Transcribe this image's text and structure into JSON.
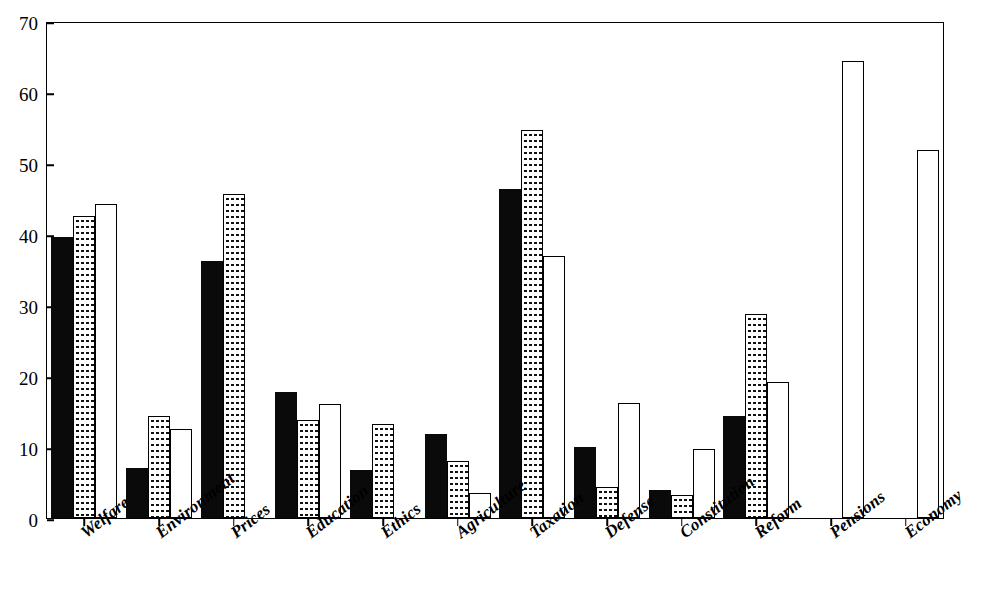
{
  "chart_data": {
    "type": "bar",
    "title": "",
    "subtitle": "",
    "xlabel": "",
    "ylabel": "",
    "ylim": [
      0,
      70
    ],
    "yticks": [
      0,
      10,
      20,
      30,
      40,
      50,
      60,
      70
    ],
    "ytick_labels": [
      "0",
      "10",
      "20",
      "30",
      "40",
      "50",
      "60",
      "70"
    ],
    "grid": false,
    "legend": "none",
    "orientation": "vertical",
    "grouping": "clustered",
    "categories": [
      "Welfare",
      "Environment",
      "Prices",
      "Education",
      "Ethics",
      "Agriculture",
      "Taxation",
      "Defense",
      "Constitution",
      "Reform",
      "Pensions",
      "Economy"
    ],
    "series": [
      {
        "name": "series-1",
        "fill": "solid-black",
        "color": "#0a0a0a",
        "values": [
          39.6,
          7.0,
          36.2,
          17.7,
          6.8,
          11.8,
          46.4,
          10.0,
          4.0,
          14.3,
          null,
          null
        ]
      },
      {
        "name": "series-2",
        "fill": "dotted-stipple",
        "color": "#ffffff",
        "values": [
          42.6,
          14.4,
          45.7,
          13.8,
          13.2,
          8.0,
          54.6,
          4.3,
          3.2,
          28.7,
          null,
          null
        ]
      },
      {
        "name": "series-3",
        "fill": "hollow-white",
        "color": "#ffffff",
        "values": [
          44.2,
          12.6,
          null,
          16.1,
          null,
          3.5,
          36.9,
          16.2,
          9.7,
          19.2,
          64.3,
          51.8
        ]
      }
    ]
  }
}
